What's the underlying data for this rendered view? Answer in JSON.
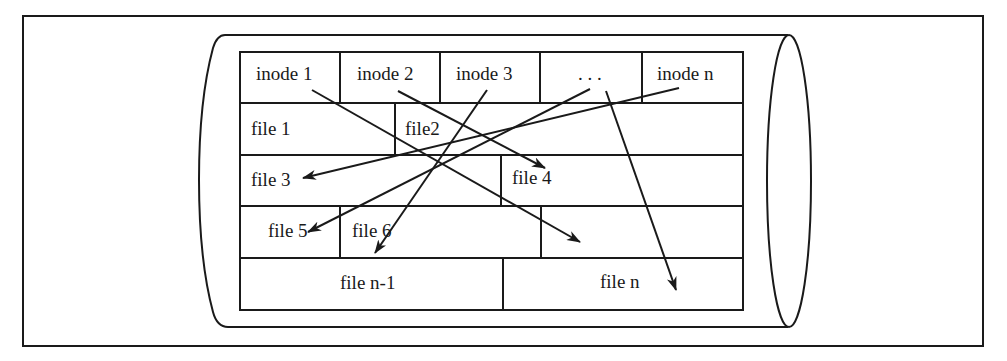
{
  "diagram": {
    "colors": {
      "stroke": "#1a1a1a",
      "background": "#ffffff"
    },
    "inode_row": [
      {
        "label": "inode 1"
      },
      {
        "label": "inode 2"
      },
      {
        "label": "inode 3"
      },
      {
        "label": ". . ."
      },
      {
        "label": "inode n"
      }
    ],
    "file_blocks": [
      {
        "label": "file 1"
      },
      {
        "label": "file2"
      },
      {
        "label": "file 3"
      },
      {
        "label": "file 4"
      },
      {
        "label": "file 5"
      },
      {
        "label": "file 6"
      },
      {
        "label": "file n-1"
      },
      {
        "label": "file n"
      }
    ],
    "pointers": [
      {
        "from": "inode 1",
        "to": "empty block (row 4)"
      },
      {
        "from": "inode 2",
        "to": "file 4"
      },
      {
        "from": "inode 3",
        "to": "file n-1"
      },
      {
        "from": ". . .",
        "to": "file 5"
      },
      {
        "from": ". . .",
        "to": "file n"
      },
      {
        "from": "inode n",
        "to": "file 3"
      }
    ]
  }
}
